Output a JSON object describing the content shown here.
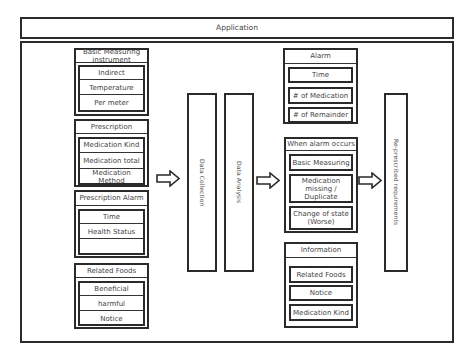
{
  "app_bar": {
    "title": "Application"
  },
  "left_groups": [
    {
      "title": "Basic Measuring instrument",
      "items": [
        "Indirect",
        "Temperature",
        "Per meter"
      ]
    },
    {
      "title": "Prescription",
      "items": [
        "Medication Kind",
        "Medication total",
        "Medication Method"
      ]
    },
    {
      "title": "Prescription Alarm",
      "items": [
        "Time",
        "Health Status",
        ""
      ]
    },
    {
      "title": "Related Foods",
      "items": [
        "Beneficial",
        "harmful",
        "Notice"
      ]
    }
  ],
  "process": {
    "collection": "Data Collection",
    "analysis": "Data Analysis"
  },
  "right_groups": [
    {
      "title": "Alarm",
      "items": [
        "Time",
        "# of Medication",
        "# of Remainder"
      ]
    },
    {
      "title": "When alarm occurs",
      "items": [
        "Basic Measuring",
        "Medication missing / Duplicate",
        "Change of state (Worse)"
      ]
    },
    {
      "title": "Information",
      "items": [
        "Related Foods",
        "Notice",
        "Medication Kind"
      ]
    }
  ],
  "output": {
    "label": "Re-prescribed requirements"
  },
  "icons": {
    "arrow": "hollow-right-arrow"
  }
}
